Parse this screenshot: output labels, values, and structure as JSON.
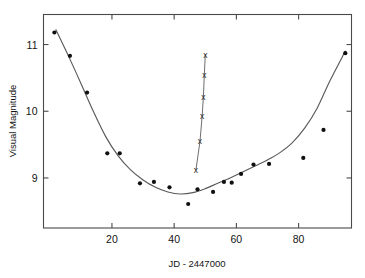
{
  "chart_data": {
    "type": "scatter",
    "title": "",
    "xlabel": "JD - 2447000",
    "ylabel": "Visual Magnitude",
    "xlim": [
      -2,
      97
    ],
    "ylim": [
      11.45,
      8.25
    ],
    "y_inverted": true,
    "grid": false,
    "legend": "none",
    "xticks": [
      20,
      40,
      60,
      80
    ],
    "xticklabels": [
      "20",
      "40",
      "60",
      "80"
    ],
    "yticks": [
      9,
      10,
      11
    ],
    "yticklabels": [
      "9",
      "10",
      "11"
    ],
    "series": [
      {
        "name": "Visual magnitude estimates",
        "marker": "filled-circle",
        "x": [
          1.5,
          6.5,
          12.0,
          18.5,
          22.5,
          29.0,
          33.5,
          38.5,
          44.5,
          47.5,
          52.5,
          56.0,
          58.5,
          61.5,
          65.5,
          70.5,
          81.5,
          88.0,
          95.0
        ],
        "y": [
          11.18,
          10.83,
          10.28,
          9.37,
          9.37,
          8.92,
          8.94,
          8.86,
          8.61,
          8.83,
          8.79,
          8.94,
          8.93,
          9.06,
          9.2,
          9.21,
          9.3,
          9.72,
          10.87
        ]
      },
      {
        "name": "Secondary decline branch",
        "marker": "cross",
        "connected": true,
        "x": [
          47.0,
          48.3,
          49.0,
          49.4,
          49.7,
          50.0
        ],
        "y": [
          9.12,
          9.55,
          9.93,
          10.22,
          10.55,
          10.85
        ]
      }
    ],
    "fit_curve": {
      "name": "Smoothed light curve",
      "x": [
        2.0,
        6.0,
        10.0,
        14.0,
        18.0,
        22.0,
        26.0,
        30.0,
        34.0,
        38.0,
        42.0,
        46.0,
        50.0,
        54.0,
        58.0,
        62.0,
        66.0,
        70.0,
        74.0,
        78.0,
        82.0,
        86.0,
        90.0,
        95.0
      ],
      "y": [
        11.22,
        10.83,
        10.42,
        10.0,
        9.62,
        9.33,
        9.12,
        8.97,
        8.86,
        8.79,
        8.76,
        8.78,
        8.84,
        8.92,
        9.0,
        9.09,
        9.18,
        9.27,
        9.38,
        9.53,
        9.75,
        10.05,
        10.45,
        10.9
      ]
    }
  },
  "axes": {
    "x_title": "JD - 2447000",
    "y_title": "Visual Magnitude"
  }
}
